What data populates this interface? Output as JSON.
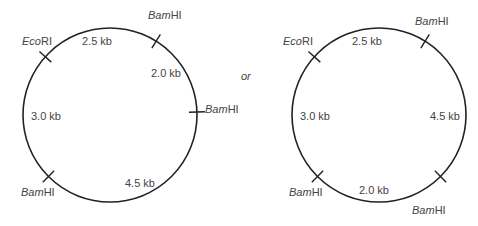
{
  "diagram": {
    "connector": "or",
    "maps": [
      {
        "id": "map-1",
        "center": [
          110,
          115
        ],
        "radius": 87,
        "sites": [
          {
            "enzyme_italic": "Eco",
            "enzyme_roman": "RI",
            "angle": 222,
            "label_pos": [
              22,
              35
            ]
          },
          {
            "enzyme_italic": "Bam",
            "enzyme_roman": "HI",
            "angle": 302,
            "label_pos": [
              148,
              9
            ]
          },
          {
            "enzyme_italic": "Bam",
            "enzyme_roman": "HI",
            "angle": 358,
            "label_pos": [
              205,
              103
            ]
          },
          {
            "enzyme_italic": "Bam",
            "enzyme_roman": "HI",
            "angle": 135,
            "label_pos": [
              21,
              186
            ]
          }
        ],
        "segments": [
          {
            "label": "2.5 kb",
            "pos": [
              82,
              35
            ]
          },
          {
            "label": "2.0 kb",
            "pos": [
              151,
              67
            ]
          },
          {
            "label": "3.0 kb",
            "pos": [
              31,
              110
            ]
          },
          {
            "label": "4.5 kb",
            "pos": [
              125,
              177
            ]
          }
        ]
      },
      {
        "id": "map-2",
        "center": [
          379,
          115
        ],
        "radius": 87,
        "sites": [
          {
            "enzyme_italic": "Eco",
            "enzyme_roman": "RI",
            "angle": 222,
            "label_pos": [
              283,
              35
            ]
          },
          {
            "enzyme_italic": "Bam",
            "enzyme_roman": "HI",
            "angle": 302,
            "label_pos": [
              415,
              15
            ]
          },
          {
            "enzyme_italic": "Bam",
            "enzyme_roman": "HI",
            "angle": 135,
            "label_pos": [
              289,
              186
            ]
          },
          {
            "enzyme_italic": "Bam",
            "enzyme_roman": "HI",
            "angle": 45,
            "label_pos": [
              412,
              204
            ]
          }
        ],
        "segments": [
          {
            "label": "2.5 kb",
            "pos": [
              352,
              35
            ]
          },
          {
            "label": "3.0 kb",
            "pos": [
              300,
              110
            ]
          },
          {
            "label": "4.5 kb",
            "pos": [
              430,
              110
            ]
          },
          {
            "label": "2.0 kb",
            "pos": [
              359,
              184
            ]
          }
        ]
      }
    ]
  }
}
